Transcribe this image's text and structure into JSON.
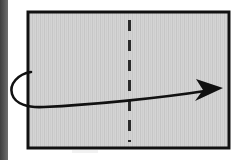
{
  "figure": {
    "title": "Paper folding step diagram",
    "caption": "",
    "canvas": {
      "width": 242,
      "height": 160,
      "background": "#ffffff"
    }
  },
  "scan_artifact": {
    "name": "left scan edge strip",
    "x": 0,
    "y": 0,
    "width": 8,
    "height": 160,
    "color": "#4a4a4a"
  },
  "paper": {
    "label": "paper sheet",
    "x": 28,
    "y": 12,
    "width": 201,
    "height": 136,
    "fill": "#d2d2d2",
    "stroke": "#111111",
    "stroke_width": 3
  },
  "fold_line": {
    "label": "vertical center fold line",
    "style": "dashed",
    "x": 129,
    "y_top": 20,
    "y_bottom": 142,
    "color": "#2b2b2b",
    "stroke_width": 3,
    "dash": "11 9"
  },
  "fold_arrow": {
    "label": "fold-around curved arrow",
    "color": "#111111",
    "stroke_width": 2.6,
    "start": {
      "x": 31,
      "y": 72
    },
    "loop_left_extent": 11,
    "tip": {
      "x": 223,
      "y": 88
    },
    "path": "M 31 72 C 18 74 9 84 12 94 C 15 104 28 108 44 107 C 90 105 160 98 205 91",
    "arrowhead": {
      "points": "223,88 196,79 203,90 195,101",
      "fill": "#111111"
    }
  },
  "texture": {
    "label": "vertical scan striping inside paper",
    "stripe_color": "#c4c4c4",
    "stripe_width": 1,
    "stripe_gap": 3
  }
}
